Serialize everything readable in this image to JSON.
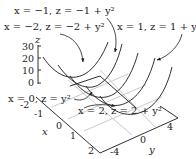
{
  "diagram": {
    "z_axis": {
      "label": "z",
      "ticks": [
        "30",
        "20",
        "10",
        "0"
      ]
    },
    "x_axis": {
      "label": "x",
      "ticks": [
        "-2",
        "-1",
        "0",
        "1",
        "2"
      ]
    },
    "y_axis": {
      "label": "y",
      "ticks": [
        "-4",
        "0",
        "4"
      ]
    },
    "annotations": [
      {
        "id": "x_neg1",
        "text": "x = −1, z = −1 + y²"
      },
      {
        "id": "x_neg2",
        "text": "x = −2, z = −2 + y²"
      },
      {
        "id": "x_pos1",
        "text": "x = 1, z = 1 + y²"
      },
      {
        "id": "x_zero",
        "text": "x = 0, z = y²"
      },
      {
        "id": "x_pos2",
        "text": "x = 2, z = 2 + y²"
      }
    ],
    "colors": {
      "ink": "#1a1a1a",
      "grid": "#bdbdbd",
      "background": "#ffffff"
    }
  }
}
